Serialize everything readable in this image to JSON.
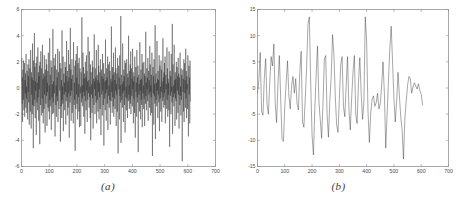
{
  "figure": {
    "background": "#ffffff",
    "axis_color": "#8c8c8c",
    "trace_color": "#2b2b2b"
  },
  "panels": [
    {
      "id": "a",
      "caption": "(a)",
      "chart_index": 0
    },
    {
      "id": "b",
      "caption": "(b)",
      "chart_index": 1
    }
  ],
  "chart_data": [
    {
      "type": "line",
      "title": "",
      "subtitle": "",
      "panel_label": "(a)",
      "xlabel": "",
      "ylabel": "",
      "xlim": [
        0,
        700
      ],
      "ylim": [
        -6,
        6
      ],
      "xticks": [
        0,
        100,
        200,
        300,
        400,
        500,
        600,
        700
      ],
      "xticklabels": [
        "0",
        "100",
        "200",
        "300",
        "400",
        "500",
        "600",
        "700"
      ],
      "yticks": [
        -6,
        -4,
        -2,
        0,
        2,
        4,
        6
      ],
      "yticklabels": [
        "-6",
        "-4",
        "-2",
        "0",
        "2",
        "4",
        "6"
      ],
      "grid": false,
      "legend": null,
      "series": [
        {
          "name": "signal-a",
          "description": "dense high-frequency zero-mean noise, samples 0-610",
          "x_start": 0,
          "x_end": 610,
          "n_points": 611,
          "y_min": -5.6,
          "y_max": 5.5,
          "y_mean": -0.1,
          "values": [
            0.5,
            2.3,
            -1.2,
            0.8,
            -2.6,
            1.4,
            0.2,
            -0.9,
            2.1,
            -1.7,
            0.3,
            1.9,
            -2.2,
            0.6,
            -0.4,
            1.1,
            -1.5,
            2.6,
            -0.8,
            0.1,
            -1.9,
            1.3,
            0.7,
            -2.4,
            1.8,
            -0.3,
            0.9,
            -1.1,
            2.2,
            -2.8,
            0.4,
            1.5,
            -0.6,
            -1.8,
            2.9,
            0.2,
            -3.1,
            1.2,
            -0.5,
            0.8,
            -2.0,
            3.4,
            -1.3,
            0.6,
            -4.6,
            2.1,
            0.3,
            -1.4,
            4.2,
            -0.9,
            1.6,
            -2.3,
            0.5,
            -0.2,
            1.9,
            -3.6,
            0.8,
            2.4,
            -1.1,
            0.4,
            -1.7,
            3.1,
            -0.7,
            1.2,
            -2.5,
            0.9,
            -0.1,
            1.7,
            -4.3,
            2.0,
            0.6,
            -1.3,
            2.8,
            -0.4,
            -2.1,
            1.5,
            0.2,
            -0.8,
            3.3,
            -1.9,
            0.7,
            -2.7,
            1.1,
            0.3,
            -1.6,
            2.5,
            -0.5,
            0.9,
            -3.4,
            1.4,
            0.1,
            -1.2,
            2.2,
            -0.6,
            1.8,
            -2.9,
            0.4,
            -0.3,
            1.3,
            -1.5,
            2.7,
            0.8,
            -1.8,
            0.2,
            -2.4,
            3.8,
            -0.9,
            1.0,
            -0.5,
            -1.4,
            2.1,
            -3.2,
            0.6,
            1.6,
            -0.7,
            0.3,
            -2.0,
            4.5,
            -1.1,
            0.5,
            -1.9,
            2.3,
            0.1,
            -0.4,
            1.7,
            -3.7,
            0.9,
            2.6,
            -1.3,
            0.2,
            -2.2,
            1.4,
            -0.6,
            0.8,
            -1.0,
            3.0,
            -2.6,
            0.4,
            1.2,
            -0.8,
            -1.6,
            2.8,
            0.3,
            -0.2,
            1.9,
            -4.1,
            0.7,
            1.5,
            -1.4,
            0.6,
            -2.3,
            4.4,
            -0.9,
            0.1,
            -1.2,
            2.4,
            -3.3,
            0.8,
            1.1,
            -0.5,
            0.4,
            -1.7,
            2.0,
            -0.3,
            1.6,
            -2.8,
            0.9,
            -1.0,
            3.6,
            0.2,
            -0.7,
            1.3,
            -2.1,
            0.5,
            -1.5,
            2.9,
            -0.4,
            0.8,
            -3.8,
            1.8,
            0.3,
            -1.1,
            4.6,
            -0.6,
            1.4,
            -2.5,
            0.7,
            -0.2,
            2.2,
            -1.9,
            0.1,
            1.0,
            -0.8,
            -2.7,
            3.5,
            0.6,
            -1.3,
            0.4,
            -0.9,
            1.7,
            -4.8,
            2.1,
            0.2,
            -1.6,
            2.6,
            -0.5,
            0.8,
            -1.2,
            3.2,
            -2.4,
            0.5,
            1.9,
            -0.7,
            0.3,
            -1.8,
            2.3,
            -3.0,
            0.9,
            1.5,
            -0.4,
            0.1,
            -2.9,
            1.2,
            0.6,
            -1.1,
            5.4,
            -0.8,
            0.2,
            -1.4,
            2.7,
            -0.3,
            1.6,
            -2.2,
            0.7,
            -0.6,
            1.1,
            -3.5,
            0.4,
            2.0,
            -1.0,
            0.8,
            -1.7,
            2.5,
            -0.2,
            1.3,
            -2.6,
            0.5,
            -0.9,
            3.9,
            1.4,
            -0.4,
            0.6,
            -1.5,
            2.8,
            -0.7,
            0.1,
            -2.3,
            1.8,
            -4.0,
            0.9,
            1.2,
            -0.5,
            0.3,
            -1.9,
            2.1,
            -0.8,
            1.6,
            -3.1,
            0.4,
            0.7,
            -1.3,
            4.1,
            -0.1,
            0.5,
            -2.0,
            1.5,
            -0.6,
            0.8,
            -1.1,
            2.9,
            -2.7,
            0.2,
            1.0,
            -0.9,
            0.6,
            -1.8,
            3.3,
            -0.3,
            1.7,
            -2.4,
            0.4,
            -0.7,
            1.2,
            -1.6,
            2.2,
            0.8,
            -3.6,
            0.1,
            1.4,
            -0.5,
            0.9,
            -2.1,
            2.6,
            -0.2,
            0.7,
            -1.3,
            1.9,
            -4.4,
            0.3,
            1.1,
            -0.8,
            0.5,
            -1.7,
            3.7,
            -0.4,
            0.6,
            -2.5,
            1.5,
            -0.1,
            0.8,
            -1.2,
            2.4,
            -3.2,
            0.9,
            1.8,
            -0.6,
            0.2,
            -1.5,
            2.0,
            -0.9,
            1.3,
            -2.8,
            0.4,
            0.7,
            -1.0,
            4.7,
            -0.3,
            0.5,
            -1.9,
            1.6,
            -0.7,
            1.0,
            -1.4,
            2.7,
            -2.2,
            0.1,
            1.2,
            -0.8,
            0.6,
            -1.6,
            3.1,
            -0.2,
            1.5,
            -2.9,
            0.3,
            -0.5,
            1.1,
            -1.8,
            2.3,
            0.9,
            -5.0,
            0.4,
            1.7,
            -0.1,
            0.8,
            -2.4,
            2.5,
            -0.6,
            0.2,
            -1.1,
            5.5,
            -4.2,
            0.7,
            1.0,
            -0.9,
            0.3,
            -1.5,
            3.4,
            -0.4,
            0.5,
            -2.6,
            1.4,
            -0.2,
            0.9,
            -1.3,
            2.1,
            -3.4,
            0.6,
            1.9,
            -0.7,
            0.1,
            -1.7,
            2.2,
            -0.8,
            1.1,
            -2.3,
            0.4,
            0.8,
            -1.0,
            4.0,
            -0.5,
            0.2,
            -1.6,
            1.3,
            -0.9,
            1.8,
            -1.2,
            2.8,
            -2.0,
            0.3,
            1.5,
            -0.6,
            0.7,
            -1.4,
            3.0,
            -0.1,
            1.2,
            -2.7,
            0.5,
            -0.8,
            0.9,
            -1.9,
            2.4,
            0.6,
            -3.8,
            0.2,
            1.6,
            -0.3,
            0.4,
            -2.2,
            2.9,
            -0.7,
            0.8,
            -1.1,
            1.7,
            -4.9,
            0.1,
            1.0,
            -0.5,
            0.3,
            -1.8,
            3.5,
            -0.2,
            0.6,
            -2.4,
            1.4,
            -0.9,
            0.7,
            -1.3,
            2.6,
            -3.0,
            0.5,
            1.9,
            -0.4,
            0.2,
            -1.6,
            2.0,
            -0.8,
            1.1,
            -2.9,
            0.9,
            0.3,
            -1.2,
            4.3,
            -0.6,
            0.4,
            -1.7,
            1.5,
            -0.1,
            0.8,
            -1.0,
            2.3,
            -2.5,
            0.7,
            1.3,
            -0.5,
            0.6,
            -1.5,
            3.2,
            -0.3,
            1.8,
            -2.1,
            0.2,
            -0.7,
            1.0,
            -1.9,
            2.7,
            0.5,
            -5.2,
            0.1,
            1.6,
            -0.4,
            0.9,
            -2.8,
            2.2,
            -0.6,
            0.3,
            -1.2,
            4.8,
            -3.9,
            0.8,
            1.1,
            -0.9,
            0.4,
            -1.4,
            3.6,
            -0.2,
            0.7,
            -2.3,
            1.3,
            -0.5,
            0.6,
            -1.1,
            2.5,
            -3.3,
            0.9,
            1.7,
            -0.8,
            0.1,
            -1.8,
            2.1,
            -0.3,
            1.4,
            -2.6,
            0.5,
            0.2,
            -1.0,
            3.8,
            -0.7,
            0.8,
            -1.5,
            1.2,
            -0.4,
            1.9,
            -1.3,
            2.4,
            -2.7,
            0.6,
            1.0,
            -0.1,
            0.3,
            -1.6,
            3.1,
            -0.9,
            1.5,
            -2.2,
            0.7,
            -0.5,
            0.4,
            -1.7,
            2.8,
            0.2,
            -4.5,
            0.8,
            1.3,
            -0.6,
            0.9,
            -2.0,
            2.6,
            -0.3,
            0.1,
            -1.1,
            4.9,
            -3.5,
            0.5,
            1.8,
            -0.7,
            0.2,
            -1.4,
            3.3,
            -0.4,
            0.6,
            -2.9,
            1.2,
            -0.8,
            0.7,
            -1.0,
            2.0,
            -2.4,
            0.3,
            1.6,
            -0.2,
            0.9,
            -1.9,
            2.3,
            -0.5,
            1.1,
            -3.1,
            0.4,
            0.8,
            -1.3,
            2.7,
            -0.6,
            0.1,
            -2.1,
            1.5,
            -0.9,
            1.0,
            -1.2,
            -5.6,
            0.5,
            1.4,
            -0.3,
            0.7,
            -1.8,
            2.2,
            -2.6,
            0.2,
            1.9,
            -0.4,
            0.6,
            -1.5,
            3.0,
            -0.8,
            1.3,
            -2.3,
            0.9,
            -0.1,
            0.3,
            -1.6,
            2.5,
            0.7,
            -3.7,
            0.4,
            1.7,
            -0.5,
            0.8,
            -2.7,
            2.1,
            -0.2,
            -1.0
          ]
        }
      ]
    },
    {
      "type": "line",
      "title": "",
      "subtitle": "",
      "panel_label": "(b)",
      "xlabel": "",
      "ylabel": "",
      "xlim": [
        0,
        700
      ],
      "ylim": [
        -15,
        15
      ],
      "xticks": [
        0,
        100,
        200,
        300,
        400,
        500,
        600,
        700
      ],
      "xticklabels": [
        "0",
        "100",
        "200",
        "300",
        "400",
        "500",
        "600",
        "700"
      ],
      "yticks": [
        -15,
        -10,
        -5,
        0,
        5,
        10,
        15
      ],
      "yticklabels": [
        "-15",
        "-10",
        "-5",
        "0",
        "5",
        "10",
        "15"
      ],
      "grid": false,
      "legend": null,
      "series": [
        {
          "name": "signal-b",
          "description": "smoother lower-frequency oscillation, samples 0-605",
          "x_start": 0,
          "x_end": 605,
          "n_points": 122,
          "sample_step": 5,
          "y_min": -13.6,
          "y_max": 13.6,
          "y_mean": -0.4,
          "values": [
            -1.0,
            1.5,
            6.8,
            -4.5,
            -5.2,
            2.0,
            5.6,
            -3.2,
            -5.0,
            1.2,
            6.0,
            4.2,
            8.4,
            -3.0,
            -6.6,
            0.8,
            6.2,
            -2.0,
            -9.8,
            -10.2,
            -3.5,
            1.0,
            5.2,
            -1.5,
            -4.0,
            0.5,
            2.2,
            -1.0,
            1.8,
            -3.0,
            -4.2,
            3.0,
            7.0,
            -6.5,
            -7.5,
            -2.0,
            4.0,
            12.2,
            13.6,
            1.0,
            -9.0,
            -12.8,
            -4.0,
            2.5,
            8.0,
            -2.5,
            -6.0,
            -9.6,
            -3.0,
            5.5,
            6.2,
            -5.0,
            -9.4,
            -2.5,
            2.0,
            10.2,
            6.5,
            -1.5,
            -7.0,
            -8.5,
            -2.0,
            4.5,
            6.0,
            -3.5,
            -5.5,
            0.5,
            6.0,
            -4.0,
            -8.0,
            -2.0,
            3.0,
            6.2,
            -5.0,
            -6.8,
            1.0,
            5.8,
            -1.0,
            -6.0,
            -2.5,
            13.6,
            9.0,
            -4.5,
            -10.4,
            -4.8,
            -2.2,
            -1.5,
            -3.5,
            -2.8,
            -1.0,
            -4.0,
            -3.0,
            0.5,
            5.0,
            -1.0,
            -11.5,
            -5.0,
            1.5,
            7.5,
            11.8,
            5.0,
            -2.0,
            -6.5,
            -2.5,
            3.0,
            -1.5,
            -5.5,
            -8.0,
            -13.6,
            -6.0,
            -2.5,
            0.5,
            2.2,
            1.8,
            -1.0,
            0.2,
            1.0,
            0.4,
            -0.2,
            0.8,
            -0.5,
            -1.2,
            -3.2
          ]
        }
      ]
    }
  ]
}
